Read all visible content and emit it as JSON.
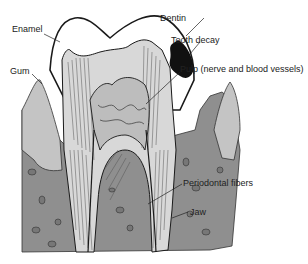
{
  "diagram": {
    "type": "anatomical-cross-section",
    "subject": "tooth",
    "labels": [
      {
        "id": "enamel",
        "text": "Enamel"
      },
      {
        "id": "dentin",
        "text": "Dentin"
      },
      {
        "id": "tooth-decay",
        "text": "Tooth decay"
      },
      {
        "id": "gum",
        "text": "Gum"
      },
      {
        "id": "pulp",
        "text": "Pulp (nerve and blood vessels)"
      },
      {
        "id": "periodontal-fibers",
        "text": "Periodontal fibers"
      },
      {
        "id": "jaw",
        "text": "Jaw"
      }
    ],
    "colors": {
      "enamel": "#ffffff",
      "dentin": "#d8d8d8",
      "pulp": "#bdbdbd",
      "decay": "#111111",
      "gum": "#c4c4c4",
      "jaw": "#8f8f8f",
      "outline": "#1a1a1a"
    }
  }
}
